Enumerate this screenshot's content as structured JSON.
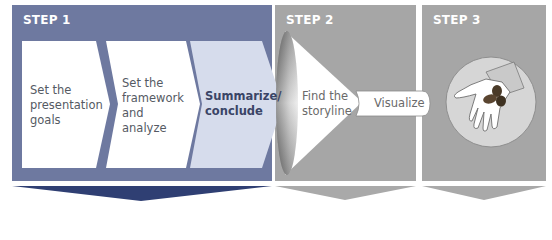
{
  "steps": [
    {
      "label": "STEP 1",
      "color": "#6e79a0",
      "arrow_color": "#2f3f73"
    },
    {
      "label": "STEP 2",
      "color": "#a6a6a6",
      "arrow_color": "#a6a6a6"
    },
    {
      "label": "STEP 3",
      "color": "#a6a6a6",
      "arrow_color": "#a6a6a6"
    }
  ],
  "step1": {
    "chevrons": [
      {
        "line1": "Set the",
        "line2": "presentation",
        "line3": "goals"
      },
      {
        "line1": "Set the",
        "line2": "framework",
        "line3": "and",
        "line4": "analyze"
      },
      {
        "line1": "Summarize/",
        "line2": "conclude",
        "highlighted": true
      }
    ]
  },
  "step2": {
    "funnel": {
      "line1": "Find the",
      "line2": "storyline"
    },
    "output_pill": "Visualize"
  },
  "step3": {
    "illustration": "hand-holding-seeds-icon"
  }
}
